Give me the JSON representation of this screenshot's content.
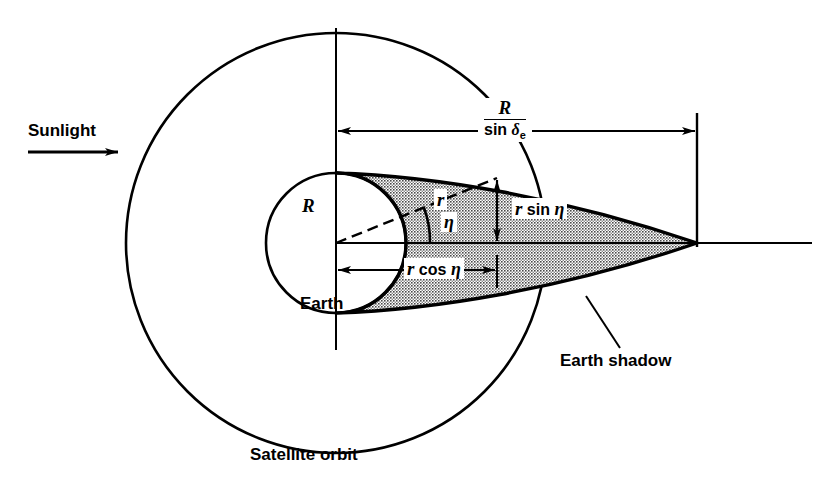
{
  "figure": {
    "background_color": "#ffffff",
    "line_color": "#000000",
    "shadow_fill": "#b9b9b9"
  },
  "labels": {
    "sunlight": "Sunlight",
    "earth": "Earth",
    "earth_shadow": "Earth shadow",
    "satellite_orbit": "Satellite orbit",
    "earth_radius": "R",
    "orbit_radius": "r",
    "eta_angle": "η",
    "r_cos_eta": {
      "var": "r",
      "fn": "cos",
      "angle": "η"
    },
    "r_sin_eta": {
      "var": "r",
      "fn": "sin",
      "angle": "η"
    },
    "shadow_length": {
      "numerator": "R",
      "denominator_fn": "sin",
      "denominator_var": "δ",
      "denominator_sub": "e"
    }
  },
  "geometry": {
    "center_x": 336,
    "center_y": 243,
    "earth_radius_px": 70,
    "orbit_radius_px": 210,
    "shadow_apex_x": 697,
    "satellite_x": 497,
    "satellite_y": 178
  }
}
